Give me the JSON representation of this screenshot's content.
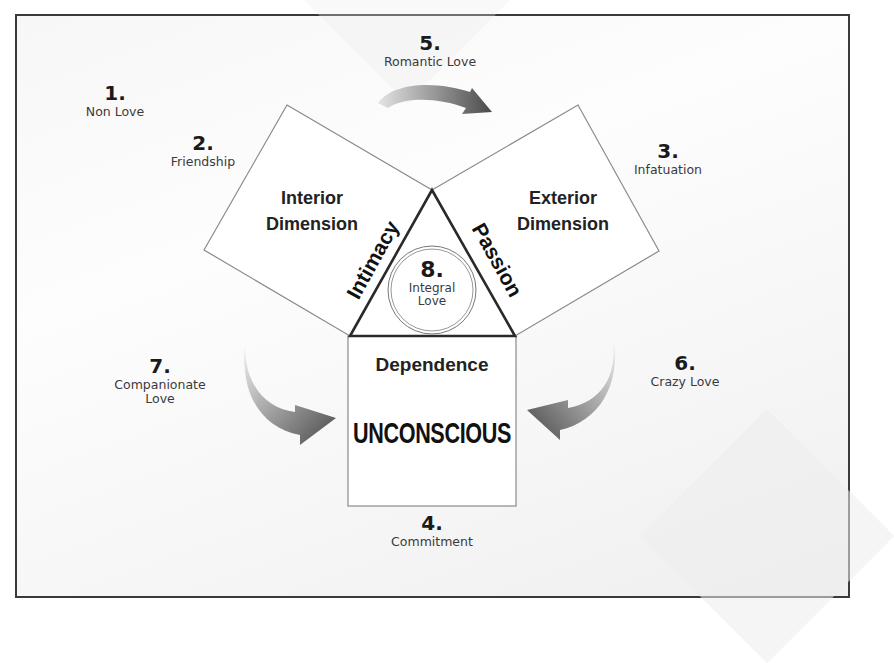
{
  "diagram": {
    "type": "love-typology-diagram",
    "shapes": {
      "left_square": {
        "label_line1": "Interior",
        "label_line2": "Dimension",
        "side_label": "Intimacy"
      },
      "right_square": {
        "label_line1": "Exterior",
        "label_line2": "Dimension",
        "side_label": "Passion"
      },
      "center_triangle": {
        "circle_number": "8.",
        "circle_label_line1": "Integral",
        "circle_label_line2": "Love"
      },
      "bottom_box": {
        "label": "Dependence",
        "subtitle": "UNCONSCIOUS"
      }
    },
    "love_types": [
      {
        "number": "1.",
        "name": "Non Love"
      },
      {
        "number": "2.",
        "name": "Friendship"
      },
      {
        "number": "3.",
        "name": "Infatuation"
      },
      {
        "number": "4.",
        "name": "Commitment"
      },
      {
        "number": "5.",
        "name": "Romantic Love"
      },
      {
        "number": "6.",
        "name": "Crazy Love"
      },
      {
        "number": "7.",
        "name_line1": "Companionate",
        "name_line2": "Love"
      }
    ],
    "arrows": [
      {
        "from": "left_square",
        "to": "right_square",
        "label_ref": "5."
      },
      {
        "from": "left",
        "to": "bottom_box",
        "label_ref": "7."
      },
      {
        "from": "right",
        "to": "bottom_box",
        "label_ref": "6."
      }
    ],
    "colors": {
      "outline": "#3a3a3a",
      "thin_outline": "#8a8a8a",
      "arrow_dark": "#555555",
      "arrow_light": "#e0e0e0",
      "text": "#1a1a1a"
    }
  }
}
